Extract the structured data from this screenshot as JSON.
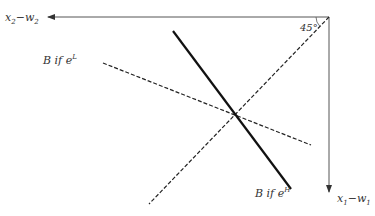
{
  "diagram": {
    "axes": {
      "horizontal": {
        "label_var": "x",
        "label_sub": "2",
        "label_minus": "−",
        "label_var2": "w",
        "label_sub2": "2"
      },
      "vertical": {
        "label_var": "x",
        "label_sub": "1",
        "label_minus": "−",
        "label_var2": "w",
        "label_sub2": "1"
      },
      "angle_label": "45°"
    },
    "lines": [
      {
        "name": "B if e^L",
        "style": "dashed",
        "label_prefix": "B if ",
        "label_base": "e",
        "label_sup": "L"
      },
      {
        "name": "B if e^H",
        "style": "solid-thick",
        "label_prefix": "B if ",
        "label_base": "e",
        "label_sup": "H"
      },
      {
        "name": "45-degree line",
        "style": "dashed"
      }
    ],
    "colors": {
      "axis": "#444444",
      "line": "#1a1a1a",
      "text": "#333333"
    }
  }
}
